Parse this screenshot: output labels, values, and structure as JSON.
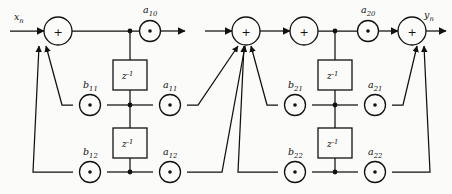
{
  "diagram": {
    "type": "signal-flow-graph",
    "background_color": "#fbfbfa",
    "line_color": "#111111"
  },
  "signals": {
    "input": {
      "base": "x",
      "subscript": "n",
      "label": "x_n"
    },
    "output": {
      "base": "y",
      "subscript": "n",
      "label": "y_n"
    }
  },
  "operators": {
    "adder_symbol": "+",
    "multiplier_symbol": "·",
    "delay_base": "z",
    "delay_exponent": "-1",
    "delay_label": "z^-1"
  },
  "sections": [
    {
      "name": "biquad-section-1",
      "index": 1,
      "feedforward": [
        {
          "base": "a",
          "subscript": "10",
          "label": "a_10",
          "name": "a10"
        },
        {
          "base": "a",
          "subscript": "11",
          "label": "a_11",
          "name": "a11"
        },
        {
          "base": "a",
          "subscript": "12",
          "label": "a_12",
          "name": "a12"
        }
      ],
      "feedback": [
        {
          "base": "b",
          "subscript": "11",
          "label": "b_11",
          "name": "b11"
        },
        {
          "base": "b",
          "subscript": "12",
          "label": "b_12",
          "name": "b12"
        }
      ],
      "delays": [
        {
          "label": "z^-1",
          "name": "delay-1-1"
        },
        {
          "label": "z^-1",
          "name": "delay-1-2"
        }
      ],
      "adders": [
        {
          "symbol": "+",
          "name": "input-adder-1"
        },
        {
          "symbol": "+",
          "name": "output-adder-1"
        }
      ]
    },
    {
      "name": "biquad-section-2",
      "index": 2,
      "feedforward": [
        {
          "base": "a",
          "subscript": "20",
          "label": "a_20",
          "name": "a20"
        },
        {
          "base": "a",
          "subscript": "21",
          "label": "a_21",
          "name": "a21"
        },
        {
          "base": "a",
          "subscript": "22",
          "label": "a_22",
          "name": "a22"
        }
      ],
      "feedback": [
        {
          "base": "b",
          "subscript": "21",
          "label": "b_21",
          "name": "b21"
        },
        {
          "base": "b",
          "subscript": "22",
          "label": "b_22",
          "name": "b22"
        }
      ],
      "delays": [
        {
          "label": "z^-1",
          "name": "delay-2-1"
        },
        {
          "label": "z^-1",
          "name": "delay-2-2"
        }
      ],
      "adders": [
        {
          "symbol": "+",
          "name": "input-adder-2"
        },
        {
          "symbol": "+",
          "name": "output-adder-2"
        }
      ]
    }
  ]
}
